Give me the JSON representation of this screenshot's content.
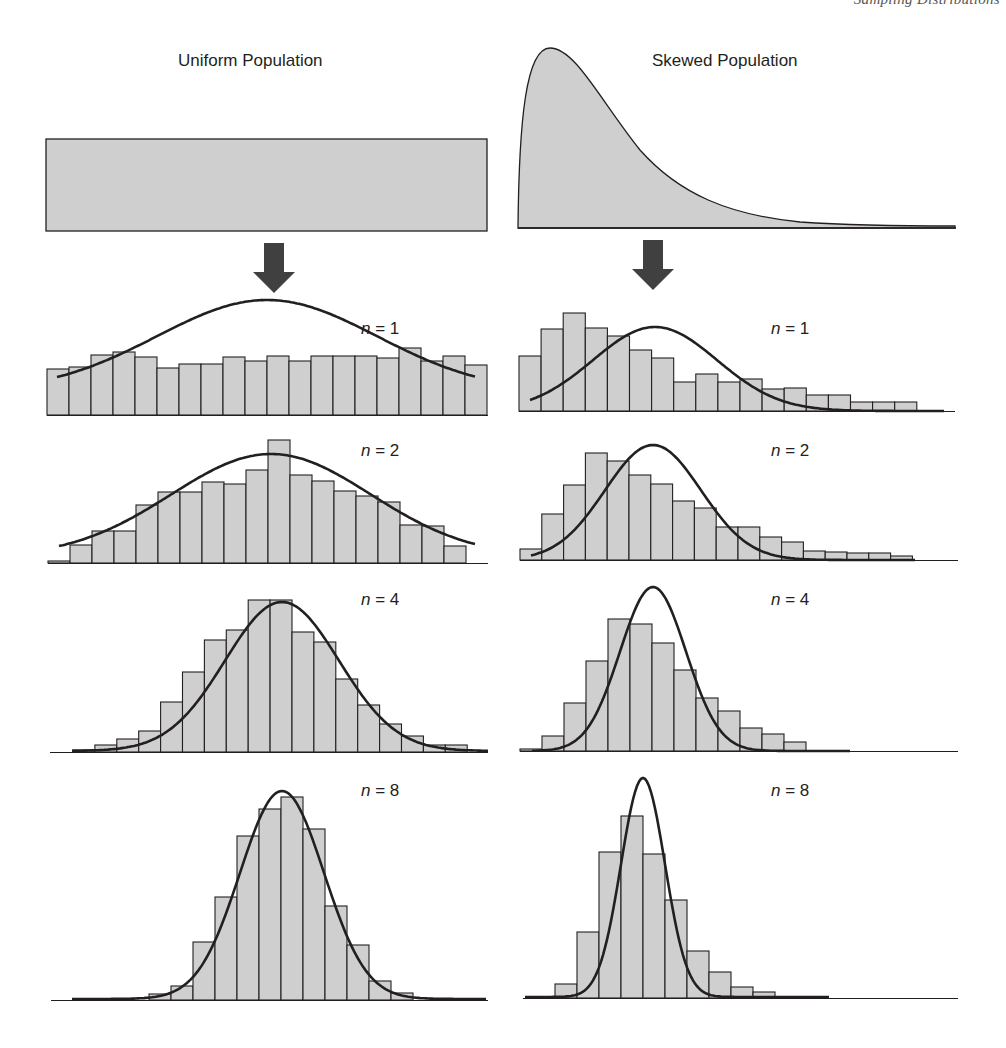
{
  "running_header": "Sampling Distributions",
  "populations": {
    "left_title": "Uniform Population",
    "right_title": "Skewed Population"
  },
  "panel_labels": {
    "n1": "n = 1",
    "n2": "n = 2",
    "n4": "n = 4",
    "n8": "n = 8",
    "n_var": "n",
    "n1_val": "= 1",
    "n2_val": "= 2",
    "n4_val": "= 4",
    "n8_val": "= 8"
  },
  "colors": {
    "bar_fill": "#cfcfcf",
    "outline": "#231f20",
    "curve": "#231f20",
    "arrow": "#404040"
  },
  "chart_data": [
    {
      "type": "bar",
      "title": "Uniform Population, n = 1",
      "sample_size": 1,
      "values": [
        46,
        48,
        60,
        63,
        58,
        47,
        51,
        51,
        58,
        54,
        59,
        54,
        59,
        59,
        59,
        57,
        67,
        54,
        59,
        50
      ],
      "overlay": "normal curve",
      "xlabel": "",
      "ylabel": ""
    },
    {
      "type": "bar",
      "title": "Skewed Population, n = 1",
      "sample_size": 1,
      "values": [
        55,
        82,
        98,
        83,
        75,
        61,
        53,
        29,
        37,
        29,
        32,
        22,
        23,
        16,
        16,
        9,
        9,
        9
      ],
      "overlay": "normal curve",
      "xlabel": "",
      "ylabel": ""
    },
    {
      "type": "bar",
      "title": "Uniform Population, n = 2",
      "sample_size": 2,
      "values": [
        2,
        18,
        32,
        32,
        58,
        71,
        71,
        81,
        79,
        93,
        123,
        88,
        82,
        72,
        67,
        61,
        38,
        37,
        17
      ],
      "overlay": "normal curve",
      "xlabel": "",
      "ylabel": ""
    },
    {
      "type": "bar",
      "title": "Skewed Population, n = 2",
      "sample_size": 2,
      "values": [
        11,
        46,
        75,
        107,
        99,
        85,
        76,
        59,
        52,
        33,
        33,
        23,
        18,
        9,
        8,
        7,
        7,
        4
      ],
      "overlay": "normal curve",
      "xlabel": "",
      "ylabel": ""
    },
    {
      "type": "bar",
      "title": "Uniform Population, n = 4",
      "sample_size": 4,
      "values": [
        2,
        7,
        13,
        21,
        50,
        80,
        112,
        122,
        152,
        152,
        120,
        110,
        73,
        47,
        28,
        16,
        7,
        7
      ],
      "overlay": "normal curve",
      "xlabel": "",
      "ylabel": ""
    },
    {
      "type": "bar",
      "title": "Skewed Population, n = 4",
      "sample_size": 4,
      "values": [
        2,
        15,
        48,
        90,
        132,
        127,
        108,
        81,
        53,
        40,
        23,
        17,
        9
      ],
      "overlay": "normal curve",
      "xlabel": "",
      "ylabel": ""
    },
    {
      "type": "bar",
      "title": "Uniform Population, n = 8",
      "sample_size": 8,
      "values": [
        6,
        14,
        58,
        103,
        164,
        191,
        203,
        171,
        94,
        55,
        19,
        7
      ],
      "overlay": "normal curve",
      "xlabel": "",
      "ylabel": ""
    },
    {
      "type": "bar",
      "title": "Skewed Population, n = 8",
      "sample_size": 8,
      "values": [
        14,
        66,
        146,
        182,
        144,
        98,
        47,
        26,
        11,
        6
      ],
      "overlay": "normal curve",
      "xlabel": "",
      "ylabel": ""
    }
  ]
}
